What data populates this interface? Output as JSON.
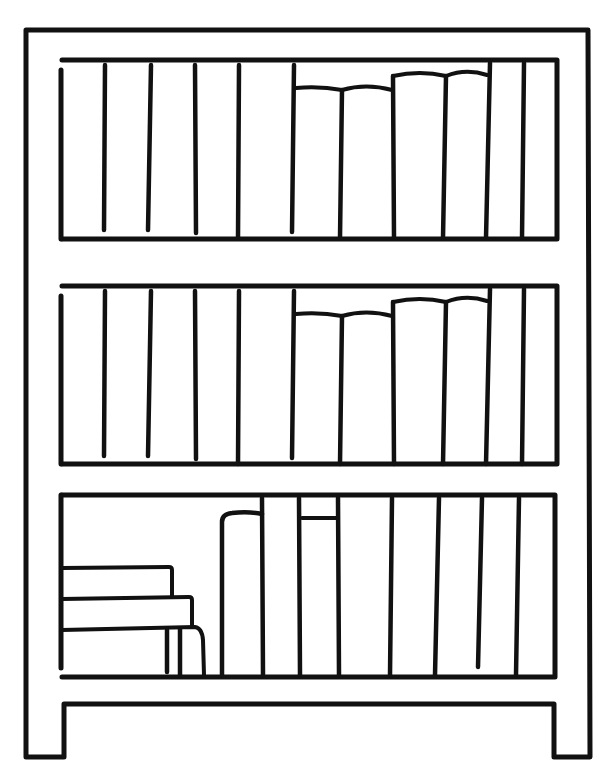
{
  "illustration": {
    "subject": "bookshelf line drawing",
    "ink_color": "#111111",
    "background_color": "#ffffff",
    "style": "black outline coloring-page",
    "shelves": [
      {
        "name": "top-shelf",
        "books": [
          {
            "kind": "tall-book",
            "count": 5
          },
          {
            "kind": "short-book-curved-top",
            "count": 2
          },
          {
            "kind": "medium-book-curved-top",
            "count": 2
          },
          {
            "kind": "tall-book",
            "count": 2
          }
        ]
      },
      {
        "name": "middle-shelf",
        "books": [
          {
            "kind": "tall-book",
            "count": 5
          },
          {
            "kind": "short-book-curved-top",
            "count": 2
          },
          {
            "kind": "medium-book-curved-top",
            "count": 2
          },
          {
            "kind": "tall-book",
            "count": 2
          }
        ]
      },
      {
        "name": "bottom-shelf",
        "books": [
          {
            "kind": "stacked-flat-book",
            "count": 3
          },
          {
            "kind": "medium-book-curved-top",
            "count": 1
          },
          {
            "kind": "tall-book",
            "count": 1
          },
          {
            "kind": "medium-book-flat-top",
            "count": 1
          },
          {
            "kind": "tall-book",
            "count": 5
          }
        ]
      }
    ]
  }
}
